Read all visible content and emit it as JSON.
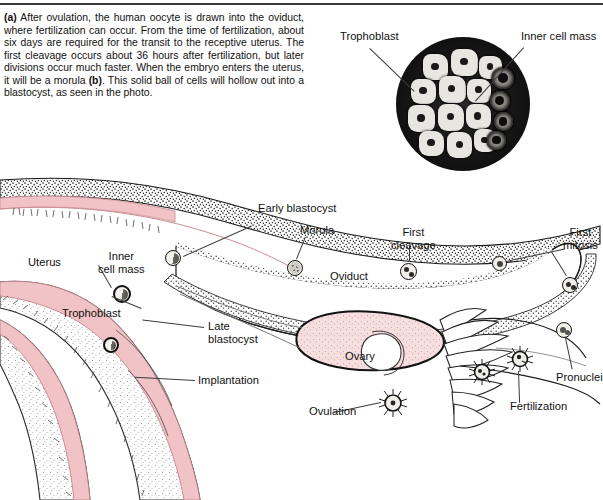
{
  "figure": {
    "caption_part_a": "(a)",
    "caption_text_1": " After ovulation, the human oocyte is drawn into the oviduct, where fertilization can occur. From the time of fertilization, about six days are required for the transit to the receptive uterus. The first cleavage occurs about 36 hours after fertilization, but later divisions occur much faster. When the embryo enters the uterus, it will be a morula ",
    "caption_part_b": "(b)",
    "caption_text_2": ". This solid ball of cells will hollow out into a blastocyst, as seen in the photo."
  },
  "photo": {
    "name": "blastocyst-micrograph",
    "labels": {
      "trophoblast": "Trophoblast",
      "inner_cell_mass": "Inner cell mass"
    }
  },
  "diagram": {
    "labels": {
      "early_blastocyst": "Early blastocyst",
      "morula": "Morula",
      "first_cleavage": "First\ncleavage",
      "first_mitosis": "First\nmitosis",
      "uterus": "Uterus",
      "inner_cell_mass": "Inner\ncell mass",
      "trophoblast": "Trophoblast",
      "oviduct": "Oviduct",
      "late_blastocyst": "Late\nblastocyst",
      "implantation": "Implantation",
      "ovary": "Ovary",
      "ovulation": "Ovulation",
      "fertilization": "Fertilization",
      "pronuclei": "Pronuclei"
    }
  },
  "colors": {
    "endometrium_pink": "#f2c3c6",
    "ovary_pink": "#f5d8d8",
    "ink": "#111111",
    "stipple_gray": "#8a8a8a"
  }
}
